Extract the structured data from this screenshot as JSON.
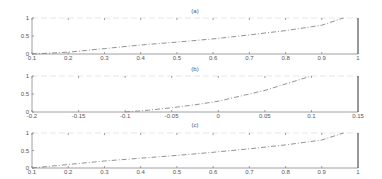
{
  "chart_data": [
    {
      "type": "line",
      "title": "(a)",
      "xlabel": "",
      "ylabel": "",
      "xlim": [
        0.1,
        1
      ],
      "ylim": [
        0,
        1
      ],
      "xticks": [
        "0.1",
        "0.2",
        "0.3",
        "0.4",
        "0.5",
        "0.6",
        "0.7",
        "0.8",
        "0.9",
        "1"
      ],
      "yticks": [
        "0",
        "0.5",
        "1"
      ],
      "x": [
        0.1,
        0.2,
        0.3,
        0.4,
        0.5,
        0.6,
        0.7,
        0.8,
        0.9,
        0.96
      ],
      "y": [
        0.0,
        0.05,
        0.15,
        0.25,
        0.33,
        0.42,
        0.53,
        0.65,
        0.8,
        1.0
      ]
    },
    {
      "type": "line",
      "title": "(b)",
      "xlabel": "",
      "ylabel": "",
      "xlim": [
        -0.2,
        0.15
      ],
      "ylim": [
        0,
        1
      ],
      "xticks": [
        "-0.2",
        "-0.15",
        "-0.1",
        "-0.05",
        "0",
        "0.05",
        "0.1",
        "0.15"
      ],
      "yticks": [
        "0",
        "0.5",
        "1"
      ],
      "x": [
        -0.1,
        -0.075,
        -0.05,
        -0.025,
        0.0,
        0.025,
        0.05,
        0.075,
        0.1
      ],
      "y": [
        0.0,
        0.05,
        0.12,
        0.2,
        0.3,
        0.45,
        0.6,
        0.8,
        1.0
      ]
    },
    {
      "type": "line",
      "title": "(c)",
      "xlabel": "",
      "ylabel": "",
      "xlim": [
        0.1,
        1
      ],
      "ylim": [
        0,
        1
      ],
      "xticks": [
        "0.1",
        "0.2",
        "0.3",
        "0.4",
        "0.5",
        "0.6",
        "0.7",
        "0.8",
        "0.9",
        "1"
      ],
      "yticks": [
        "0",
        "0.5",
        "1"
      ],
      "x": [
        0.1,
        0.2,
        0.3,
        0.4,
        0.5,
        0.6,
        0.7,
        0.8,
        0.9,
        0.96
      ],
      "y": [
        0.0,
        0.1,
        0.2,
        0.28,
        0.36,
        0.45,
        0.55,
        0.66,
        0.8,
        1.0
      ]
    }
  ]
}
